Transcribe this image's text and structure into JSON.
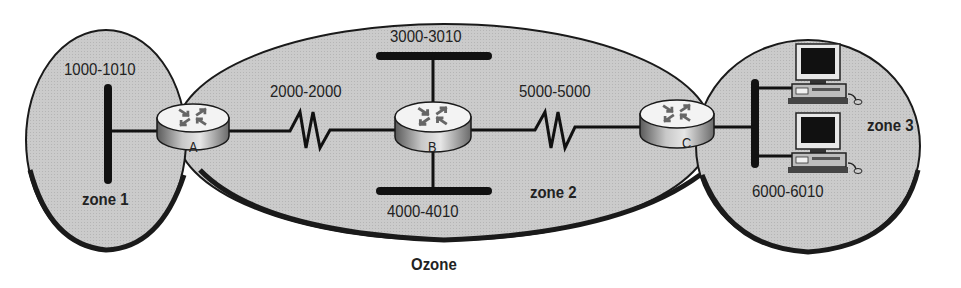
{
  "diagram": {
    "title": "Ozone",
    "colors": {
      "zone_fill": "#c9c9c9",
      "outline": "#1a1a1a",
      "router_top": "#f2f2f2",
      "router_side": "#9a9a9a",
      "background": "#ffffff"
    },
    "zones": [
      {
        "id": "zone1",
        "label": "zone 1",
        "network_range": "1000-1010"
      },
      {
        "id": "zone2",
        "label": "zone 2",
        "network_ranges": [
          "3000-3010",
          "4000-4010"
        ]
      },
      {
        "id": "zone3",
        "label": "zone 3",
        "network_range": "6000-6010"
      }
    ],
    "routers": [
      {
        "id": "A",
        "label": "A"
      },
      {
        "id": "B",
        "label": "B"
      },
      {
        "id": "C",
        "label": "C"
      }
    ],
    "links": [
      {
        "from": "A",
        "to": "B",
        "type": "serial",
        "network_range": "2000-2000"
      },
      {
        "from": "B",
        "to": "C",
        "type": "serial",
        "network_range": "5000-5000"
      }
    ],
    "hosts": [
      {
        "id": "workstation-1",
        "zone": "zone3"
      },
      {
        "id": "workstation-2",
        "zone": "zone3"
      }
    ],
    "labels": {
      "net_1000": "1000-1010",
      "net_2000": "2000-2000",
      "net_3000": "3000-3010",
      "net_4000": "4000-4010",
      "net_5000": "5000-5000",
      "net_6000": "6000-6010",
      "zone1": "zone 1",
      "zone2": "zone 2",
      "zone3": "zone 3",
      "router_a": "A",
      "router_b": "B",
      "router_c": "C",
      "ozone": "Ozone"
    }
  }
}
